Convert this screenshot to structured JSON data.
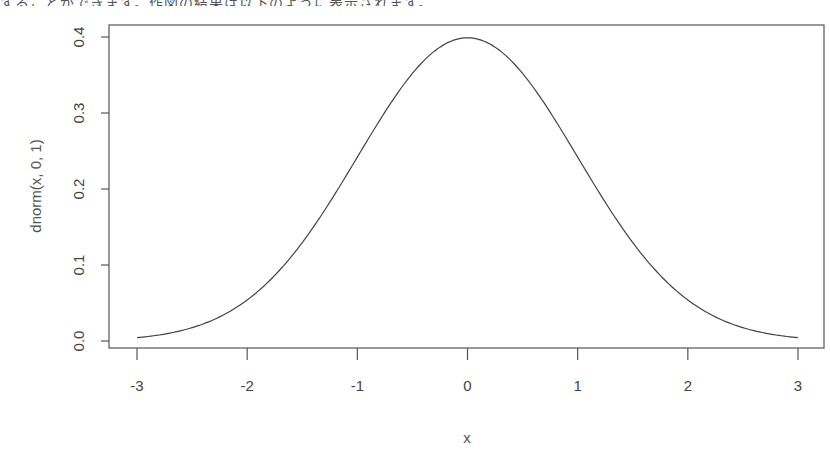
{
  "top_text": "することができます。作図の結果は以下のように表示されます。",
  "chart_data": {
    "type": "line",
    "title": "",
    "xlabel": "x",
    "ylabel": "dnorm(x, 0, 1)",
    "xlim": [
      -3,
      3
    ],
    "ylim": [
      0,
      0.4
    ],
    "x_ticks": [
      "-3",
      "-2",
      "-1",
      "0",
      "1",
      "2",
      "3"
    ],
    "y_ticks": [
      "0.0",
      "0.1",
      "0.2",
      "0.3",
      "0.4"
    ],
    "grid": false,
    "legend": null,
    "series": [
      {
        "name": "dnorm(x, 0, 1)",
        "x": [
          -3,
          -2.75,
          -2.5,
          -2.25,
          -2,
          -1.75,
          -1.5,
          -1.25,
          -1,
          -0.75,
          -0.5,
          -0.25,
          0,
          0.25,
          0.5,
          0.75,
          1,
          1.25,
          1.5,
          1.75,
          2,
          2.25,
          2.5,
          2.75,
          3
        ],
        "values": [
          0.0044,
          0.0091,
          0.0175,
          0.0317,
          0.054,
          0.0863,
          0.1295,
          0.1826,
          0.242,
          0.3011,
          0.3521,
          0.3867,
          0.3989,
          0.3867,
          0.3521,
          0.3011,
          0.242,
          0.1826,
          0.1295,
          0.0863,
          0.054,
          0.0317,
          0.0175,
          0.0091,
          0.0044
        ]
      }
    ]
  }
}
